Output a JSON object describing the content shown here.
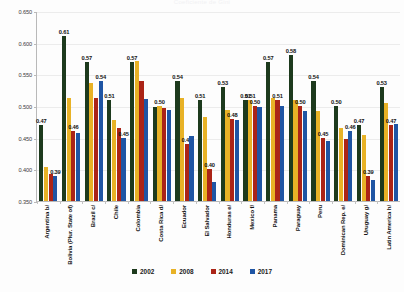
{
  "chart_data": {
    "type": "bar",
    "title": "Coeficiente de Gini",
    "xlabel": "",
    "ylabel": "",
    "ylim": [
      0.35,
      0.65
    ],
    "ytick_labels": [
      "0.650",
      "0.600",
      "0.550",
      "0.500",
      "0.450",
      "0.400",
      "0.350"
    ],
    "ytick_values": [
      0.65,
      0.6,
      0.55,
      0.5,
      0.45,
      0.4,
      0.35
    ],
    "grid": true,
    "legend_position": "bottom",
    "categories": [
      "Argentina b/",
      "Bolivia (Plur. State of)",
      "Brazil c/",
      "Chile",
      "Colombia",
      "Costa Rica d/",
      "Ecuador",
      "El Salvador",
      "Honduras e/",
      "Mexico f/",
      "Panama",
      "Paraguay",
      "Peru",
      "Dominican Rep. e/",
      "Uruguay g/",
      "Latin America h/"
    ],
    "series": [
      {
        "name": "2002",
        "color": "#1d3a1d",
        "values": [
          0.47,
          0.61,
          0.57,
          0.51,
          0.57,
          0.499,
          0.54,
          0.51,
          0.53,
          0.51,
          0.57,
          0.58,
          0.54,
          0.5,
          0.47,
          0.53
        ],
        "labels": [
          "0.47",
          "0.61",
          "0.57",
          "0.51",
          "0.57",
          "",
          "0.54",
          "0.51",
          "0.53",
          "0.51",
          "0.57",
          "0.58",
          "0.54",
          "0.50",
          "0.47",
          "0.53"
        ]
      },
      {
        "name": "2008",
        "color": "#e8b226",
        "values": [
          0.403,
          0.512,
          0.536,
          0.478,
          0.571,
          0.5,
          0.513,
          0.482,
          0.493,
          0.51,
          0.512,
          0.509,
          0.492,
          0.466,
          0.455,
          0.505
        ],
        "labels": [
          "",
          "",
          "",
          "",
          "",
          "0.50",
          "",
          "",
          "",
          "0.51",
          "",
          "",
          "",
          "",
          "",
          ""
        ]
      },
      {
        "name": "2014",
        "color": "#ab2417",
        "values": [
          0.392,
          0.46,
          0.513,
          0.466,
          0.539,
          0.497,
          0.44,
          0.4,
          0.48,
          0.5,
          0.51,
          0.5,
          0.45,
          0.448,
          0.39,
          0.47
        ],
        "labels": [
          "",
          "0.46",
          "",
          "",
          "",
          "",
          "0.44",
          "0.40",
          "0.48",
          "0.50",
          "0.51",
          "0.50",
          "0.45",
          "",
          "0.39",
          "0.47"
        ]
      },
      {
        "name": "2017",
        "color": "#1f55a4",
        "values": [
          0.39,
          0.458,
          0.54,
          0.45,
          0.511,
          0.494,
          0.453,
          0.38,
          0.478,
          0.499,
          0.5,
          0.492,
          0.445,
          0.46,
          0.383,
          0.472
        ],
        "labels": [
          "0.39",
          "",
          "0.54",
          "0.45",
          "",
          "",
          "",
          "",
          "",
          "",
          "",
          "",
          "",
          "0.46",
          "",
          ""
        ]
      }
    ]
  },
  "legend": {
    "items": [
      {
        "label": "2002",
        "color": "#1d3a1d"
      },
      {
        "label": "2008",
        "color": "#e8b226"
      },
      {
        "label": "2014",
        "color": "#ab2417"
      },
      {
        "label": "2017",
        "color": "#1f55a4"
      }
    ]
  }
}
